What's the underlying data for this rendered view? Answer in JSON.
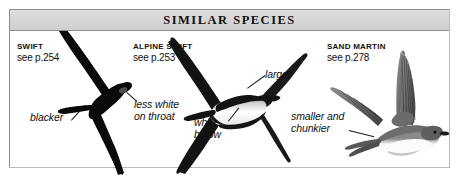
{
  "panel": {
    "header_title": "SIMILAR  SPECIES",
    "border_color": "#8e8e8e",
    "header_fill": "#d6d6d6",
    "background": "#ffffff"
  },
  "species": [
    {
      "id": "swift",
      "name": "SWIFT",
      "page_ref": "see p.254"
    },
    {
      "id": "alpine-swift",
      "name": "ALPINE SWIFT",
      "page_ref": "see p.253"
    },
    {
      "id": "sand-martin",
      "name": "SAND MARTIN",
      "page_ref": "see p.278"
    }
  ],
  "callouts": {
    "blacker": "blacker",
    "less_white_line1": "less white",
    "less_white_line2": "on throat",
    "white_line1": "white",
    "white_line2": "below",
    "larger": "larger",
    "smaller_line1": "smaller and",
    "smaller_line2": "chunkier"
  },
  "artwork": {
    "swift_color": "#0a0a0a",
    "alpine_body_color": "#111111",
    "alpine_belly_color": "#f2f2f2",
    "sand_martin_upper_color": "#7d7d7d",
    "sand_martin_under_color": "#fbfbfb"
  }
}
